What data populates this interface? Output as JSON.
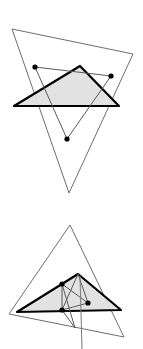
{
  "figure": {
    "width": 143,
    "height": 349,
    "background_color": "#ffffff",
    "styles": {
      "outline_stroke": "#6e6e6e",
      "outline_width": 1,
      "bold_stroke": "#000000",
      "bold_width": 2.2,
      "shade_fill": "#e0e0e0",
      "connector_stroke": "#595959",
      "connector_width": 1,
      "point_fill": "#000000",
      "point_radius": 2.6
    },
    "panels": [
      {
        "name": "upper-panel",
        "label": "top figure",
        "outline_triangle": {
          "name": "outer-thin-triangle-upper",
          "points": [
            [
              12,
              29
            ],
            [
              133,
              54
            ],
            [
              69,
              193
            ]
          ]
        },
        "shaded_triangle": {
          "name": "shaded-bold-triangle-upper",
          "points": [
            [
              14,
              106
            ],
            [
              80,
              66
            ],
            [
              119,
              106
            ]
          ],
          "filled": true
        },
        "inner_triangle": {
          "name": "inner-point-triangle-upper",
          "points": [
            [
              35,
              67
            ],
            [
              111,
              76
            ],
            [
              67,
              139
            ]
          ]
        },
        "marked_points": [
          {
            "name": "point-a-upper",
            "x": 35,
            "y": 67
          },
          {
            "name": "point-b-upper",
            "x": 111,
            "y": 76
          },
          {
            "name": "point-c-upper",
            "x": 67,
            "y": 139
          }
        ]
      },
      {
        "name": "lower-panel",
        "label": "bottom figure",
        "outline_triangle": {
          "name": "outer-thin-triangle-lower",
          "points": [
            [
              70,
              225
            ],
            [
              124,
              337
            ],
            [
              9,
              314
            ]
          ]
        },
        "shaded_triangle": {
          "name": "shaded-bold-triangle-lower",
          "points": [
            [
              17,
              312
            ],
            [
              78,
              274
            ],
            [
              121,
              310
            ]
          ],
          "filled": true
        },
        "inner_triangle": {
          "name": "inner-point-triangle-lower",
          "points": [
            [
              62,
              284
            ],
            [
              88,
              303
            ],
            [
              62,
              310
            ]
          ]
        },
        "marked_points": [
          {
            "name": "point-a-lower",
            "x": 62,
            "y": 284
          },
          {
            "name": "point-b-lower",
            "x": 88,
            "y": 303
          },
          {
            "name": "point-c-lower",
            "x": 62,
            "y": 310
          }
        ]
      }
    ]
  }
}
